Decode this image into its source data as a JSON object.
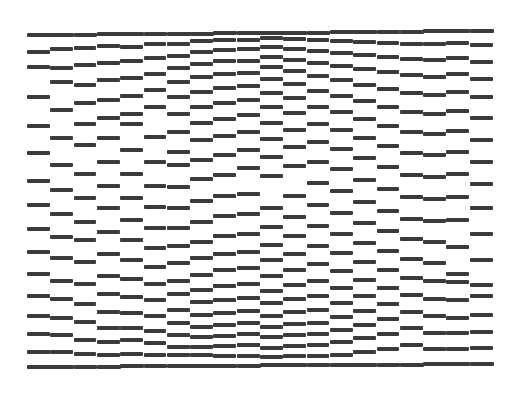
{
  "title": "Print head nozzle check pattern",
  "colors": {
    "ink": "#3b3b3b",
    "paper": "#ffffff"
  },
  "pattern": {
    "x_start": 27,
    "x_end": 493,
    "column_count": 20,
    "bar_height": 4,
    "top_line": {
      "y_left": 35,
      "y_right": 31
    },
    "bottom_line": {
      "y_left": 367,
      "y_right": 364
    },
    "columns": [
      [
        52,
        67,
        97,
        126,
        153,
        181,
        205,
        229,
        252,
        274,
        296,
        316,
        334,
        352
      ],
      [
        49,
        68,
        82,
        110,
        138,
        165,
        190,
        214,
        237,
        258,
        281,
        299,
        318,
        335,
        352
      ],
      [
        48,
        65,
        85,
        103,
        124,
        145,
        174,
        198,
        222,
        240,
        262,
        284,
        304,
        322,
        340,
        354
      ],
      [
        46,
        63,
        80,
        100,
        118,
        138,
        162,
        186,
        208,
        232,
        254,
        276,
        294,
        312,
        328,
        342,
        355
      ],
      [
        47,
        61,
        78,
        96,
        114,
        124,
        150,
        174,
        198,
        220,
        240,
        260,
        279,
        297,
        313,
        328,
        340,
        354
      ],
      [
        44,
        58,
        74,
        90,
        107,
        137,
        162,
        186,
        207,
        228,
        248,
        267,
        284,
        300,
        316,
        331,
        343,
        355
      ],
      [
        44,
        56,
        68,
        82,
        97,
        114,
        132,
        152,
        165,
        187,
        208,
        228,
        246,
        263,
        281,
        294,
        310,
        323,
        335,
        347,
        355
      ],
      [
        41,
        52,
        64,
        77,
        92,
        107,
        123,
        140,
        160,
        179,
        201,
        222,
        242,
        258,
        275,
        290,
        302,
        315,
        327,
        337,
        347,
        355
      ],
      [
        40,
        50,
        61,
        74,
        88,
        103,
        119,
        136,
        155,
        175,
        196,
        216,
        236,
        254,
        270,
        286,
        300,
        313,
        325,
        336,
        346,
        356
      ],
      [
        40,
        49,
        61,
        73,
        86,
        100,
        115,
        132,
        150,
        168,
        194,
        214,
        234,
        252,
        268,
        284,
        298,
        311,
        323,
        334,
        345,
        356
      ],
      [
        38,
        47,
        57,
        67,
        79,
        93,
        107,
        123,
        139,
        157,
        176,
        208,
        227,
        245,
        260,
        276,
        291,
        303,
        316,
        327,
        337,
        348,
        357
      ],
      [
        39,
        49,
        60,
        71,
        84,
        98,
        113,
        130,
        147,
        166,
        196,
        217,
        236,
        254,
        270,
        285,
        299,
        312,
        324,
        335,
        346,
        356
      ],
      [
        40,
        51,
        63,
        76,
        91,
        107,
        124,
        142,
        162,
        183,
        205,
        226,
        246,
        264,
        281,
        296,
        310,
        323,
        334,
        345,
        356
      ],
      [
        41,
        53,
        66,
        80,
        96,
        112,
        130,
        149,
        169,
        191,
        213,
        234,
        253,
        271,
        288,
        303,
        317,
        330,
        342,
        355
      ],
      [
        42,
        55,
        69,
        85,
        101,
        119,
        138,
        158,
        180,
        202,
        223,
        243,
        262,
        280,
        296,
        311,
        325,
        338,
        352
      ],
      [
        43,
        57,
        72,
        89,
        107,
        126,
        146,
        167,
        189,
        211,
        231,
        251,
        270,
        288,
        304,
        319,
        334,
        349
      ],
      [
        44,
        59,
        75,
        93,
        112,
        132,
        153,
        175,
        197,
        219,
        239,
        259,
        278,
        295,
        312,
        328,
        345
      ],
      [
        44,
        60,
        77,
        95,
        114,
        134,
        155,
        177,
        199,
        221,
        242,
        263,
        281,
        299,
        316,
        333,
        349
      ],
      [
        43,
        58,
        74,
        92,
        111,
        131,
        152,
        174,
        197,
        220,
        247,
        274,
        282,
        300,
        318,
        333,
        349
      ],
      [
        45,
        62,
        79,
        97,
        118,
        140,
        162,
        184,
        208,
        234,
        260,
        285,
        296,
        315,
        332,
        348
      ]
    ]
  }
}
